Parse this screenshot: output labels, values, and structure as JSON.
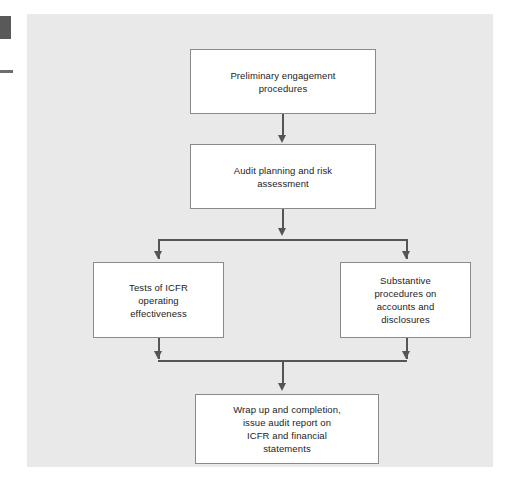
{
  "figure": {
    "type": "flowchart",
    "orientation": "top-to-bottom",
    "panel_background": "#e9e9e9",
    "node_fill": "#ffffff",
    "node_border": "#8a8a8a",
    "connector_color": "#555555",
    "nodes": [
      {
        "id": "preliminary",
        "label": "Preliminary engagement procedures",
        "lines": [
          "Preliminary engagement",
          "procedures"
        ]
      },
      {
        "id": "planning",
        "label": "Audit planning and risk assessment",
        "lines": [
          "Audit planning and risk",
          "assessment"
        ]
      },
      {
        "id": "icfr-tests",
        "label": "Tests of ICFR operating effectiveness",
        "lines": [
          "Tests of ICFR",
          "operating",
          "effectiveness"
        ]
      },
      {
        "id": "substantive",
        "label": "Substantive procedures on accounts and disclosures",
        "lines": [
          "Substantive",
          "procedures on",
          "accounts and",
          "disclosures"
        ]
      },
      {
        "id": "wrapup",
        "label": "Wrap up and completion, issue audit report on ICFR and financial statements",
        "lines": [
          "Wrap up and completion,",
          "issue audit report on",
          "ICFR and financial",
          "statements"
        ]
      }
    ],
    "edges": [
      {
        "from": "preliminary",
        "to": "planning",
        "style": "arrow"
      },
      {
        "from": "planning",
        "to": "split",
        "style": "arrow"
      },
      {
        "from": "split",
        "to": "icfr-tests",
        "style": "arrow"
      },
      {
        "from": "split",
        "to": "substantive",
        "style": "arrow"
      },
      {
        "from": "icfr-tests",
        "to": "merge",
        "style": "arrow"
      },
      {
        "from": "substantive",
        "to": "merge",
        "style": "arrow"
      },
      {
        "from": "merge",
        "to": "wrapup",
        "style": "arrow"
      }
    ]
  },
  "margin_marks": {
    "block_color": "#595959",
    "rule_color": "#6e6e6e"
  }
}
